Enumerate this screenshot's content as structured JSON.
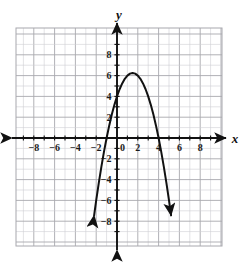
{
  "figure": {
    "background_color": "#ffffff",
    "grid_color": "#cfcfd4",
    "grid_major_color": "#a8a8ae",
    "axis_color": "#111111",
    "curve_color": "#111111"
  },
  "chart_data": {
    "type": "line",
    "title": "",
    "subtitle": "",
    "xlabel": "x",
    "ylabel": "y",
    "xlim": [
      -10,
      10
    ],
    "ylim": [
      -10,
      10
    ],
    "grid": true,
    "grid_step": 1,
    "legend": "none",
    "x_tick_labels": [
      "-8",
      "-6",
      "-4",
      "-2",
      "0",
      "2",
      "4",
      "6",
      "8"
    ],
    "x_tick_values": [
      -8,
      -6,
      -4,
      -2,
      0,
      2,
      4,
      6,
      8
    ],
    "y_tick_labels": [
      "8",
      "6",
      "4",
      "2",
      "-2",
      "-4",
      "-6",
      "-8"
    ],
    "y_tick_values": [
      8,
      6,
      4,
      2,
      -2,
      -4,
      -6,
      -8
    ],
    "series": [
      {
        "name": "parabola",
        "equation": "y = -x^2 + 3x + 4",
        "vertex": [
          1.5,
          6.25
        ],
        "x_intercepts": [
          -1,
          4
        ],
        "y_intercept": 4,
        "arrow_start": true,
        "arrow_end": true,
        "x": [
          -2.2,
          -2.0,
          -1.75,
          -1.5,
          -1.25,
          -1.0,
          -0.75,
          -0.5,
          -0.25,
          0,
          0.25,
          0.5,
          0.75,
          1.0,
          1.25,
          1.5,
          1.75,
          2.0,
          2.25,
          2.5,
          2.75,
          3.0,
          3.25,
          3.5,
          3.75,
          4.0,
          4.25,
          4.5,
          4.75,
          5.0,
          5.2
        ],
        "y": [
          -7.44,
          -6.0,
          -4.3125,
          -2.75,
          -1.3125,
          0,
          1.1875,
          2.25,
          3.1875,
          4,
          4.6875,
          5.25,
          5.6875,
          6.0,
          6.1875,
          6.25,
          6.1875,
          6.0,
          5.6875,
          5.25,
          4.6875,
          4.0,
          3.1875,
          2.25,
          1.1875,
          0,
          -1.3125,
          -2.75,
          -4.3125,
          -6.0,
          -7.44
        ]
      }
    ]
  },
  "axis_labels": {
    "x": "x",
    "y": "y"
  }
}
